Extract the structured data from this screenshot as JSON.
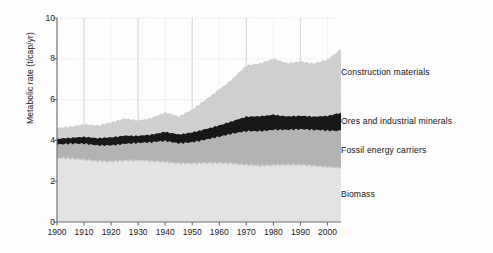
{
  "figure": {
    "kind": "scanned-stacked-area-chart",
    "background": "#ffffff"
  },
  "axes": {
    "ylabel": "Metabolic rate (t/cap/yr)",
    "xlabel": "",
    "y_ticks": [
      {
        "value": 0,
        "label": "0"
      },
      {
        "value": 2,
        "label": "2"
      },
      {
        "value": 4,
        "label": "4"
      },
      {
        "value": 6,
        "label": "6"
      },
      {
        "value": 8,
        "label": "8"
      },
      {
        "value": 10,
        "label": "10"
      }
    ],
    "x_ticks": [
      {
        "value": 1900,
        "label": "1900"
      },
      {
        "value": 1910,
        "label": "1910"
      },
      {
        "value": 1920,
        "label": "1920"
      },
      {
        "value": 1930,
        "label": "1930"
      },
      {
        "value": 1940,
        "label": "1940"
      },
      {
        "value": 1950,
        "label": "1950"
      },
      {
        "value": 1960,
        "label": "1960"
      },
      {
        "value": 1970,
        "label": "1970"
      },
      {
        "value": 1980,
        "label": "1980"
      },
      {
        "value": 1990,
        "label": "1990"
      },
      {
        "value": 2000,
        "label": "2000"
      }
    ],
    "xlim": [
      1900,
      2005
    ],
    "ylim": [
      0,
      10
    ],
    "grid": true,
    "grid_color": "#d8d8d8"
  },
  "legend": {
    "position": "right-outside",
    "entries": [
      {
        "label": "Construction materials",
        "color": "#d0d0d0"
      },
      {
        "label": "Ores and industrial minerals",
        "color": "#141414"
      },
      {
        "label": "Fossil energy carriers",
        "color": "#b3b3b3"
      },
      {
        "label": "Biomass",
        "color": "#e4e4e4"
      }
    ]
  },
  "chart_data": {
    "type": "area",
    "title": "",
    "subtitle": "",
    "xlabel": "",
    "ylabel": "Metabolic rate (t/cap/yr)",
    "xlim": [
      1900,
      2005
    ],
    "ylim": [
      0,
      10
    ],
    "grid": true,
    "legend_position": "right-outside",
    "stacked": true,
    "stack_order_bottom_to_top": [
      "Biomass",
      "Fossil energy carriers",
      "Ores and industrial minerals",
      "Construction materials"
    ],
    "x": [
      1900,
      1905,
      1910,
      1915,
      1920,
      1925,
      1930,
      1935,
      1940,
      1945,
      1950,
      1955,
      1960,
      1965,
      1970,
      1975,
      1980,
      1985,
      1990,
      1995,
      2000,
      2005
    ],
    "series": [
      {
        "name": "Biomass",
        "color": "#e4e4e4",
        "values": [
          3.1,
          3.08,
          3.05,
          3.02,
          3.0,
          3.0,
          2.98,
          2.95,
          2.95,
          2.92,
          2.9,
          2.88,
          2.86,
          2.84,
          2.82,
          2.8,
          2.8,
          2.78,
          2.76,
          2.74,
          2.72,
          2.7
        ]
      },
      {
        "name": "Fossil energy carriers",
        "color": "#b3b3b3",
        "values": [
          0.7,
          0.72,
          0.76,
          0.74,
          0.8,
          0.86,
          0.88,
          0.92,
          1.0,
          0.96,
          1.05,
          1.18,
          1.3,
          1.45,
          1.62,
          1.68,
          1.76,
          1.74,
          1.76,
          1.74,
          1.76,
          1.8
        ]
      },
      {
        "name": "Ores and industrial minerals",
        "color": "#141414",
        "values": [
          0.3,
          0.32,
          0.34,
          0.33,
          0.36,
          0.4,
          0.38,
          0.4,
          0.44,
          0.4,
          0.46,
          0.52,
          0.58,
          0.64,
          0.7,
          0.7,
          0.72,
          0.68,
          0.68,
          0.66,
          0.7,
          0.86
        ]
      },
      {
        "name": "Construction materials",
        "color": "#d0d0d0",
        "values": [
          0.55,
          0.58,
          0.62,
          0.6,
          0.7,
          0.84,
          0.78,
          0.84,
          0.96,
          0.86,
          1.1,
          1.46,
          1.8,
          2.1,
          2.5,
          2.56,
          2.74,
          2.62,
          2.7,
          2.62,
          2.74,
          3.1
        ]
      }
    ],
    "stacked_top_values": {
      "note": "cumulative top of each band, bottom-to-top",
      "Biomass": [
        3.1,
        3.08,
        3.05,
        3.02,
        3.0,
        3.0,
        2.98,
        2.95,
        2.95,
        2.92,
        2.9,
        2.88,
        2.86,
        2.84,
        2.82,
        2.8,
        2.8,
        2.78,
        2.76,
        2.74,
        2.72,
        2.7
      ],
      "Fossil energy carriers": [
        3.8,
        3.8,
        3.81,
        3.76,
        3.8,
        3.86,
        3.86,
        3.87,
        3.95,
        3.88,
        3.95,
        4.06,
        4.16,
        4.29,
        4.44,
        4.48,
        4.56,
        4.52,
        4.52,
        4.48,
        4.48,
        4.5
      ],
      "Ores and industrial minerals": [
        4.1,
        4.12,
        4.15,
        4.09,
        4.16,
        4.26,
        4.24,
        4.27,
        4.39,
        4.28,
        4.41,
        4.58,
        4.74,
        4.93,
        5.14,
        5.18,
        5.28,
        5.2,
        5.2,
        5.14,
        5.18,
        5.36
      ],
      "Construction materials": [
        4.65,
        4.7,
        4.77,
        4.69,
        4.86,
        5.1,
        5.02,
        5.11,
        5.35,
        5.14,
        5.51,
        6.04,
        6.54,
        7.03,
        7.64,
        7.74,
        8.02,
        7.82,
        7.9,
        7.76,
        7.92,
        8.46
      ]
    }
  }
}
